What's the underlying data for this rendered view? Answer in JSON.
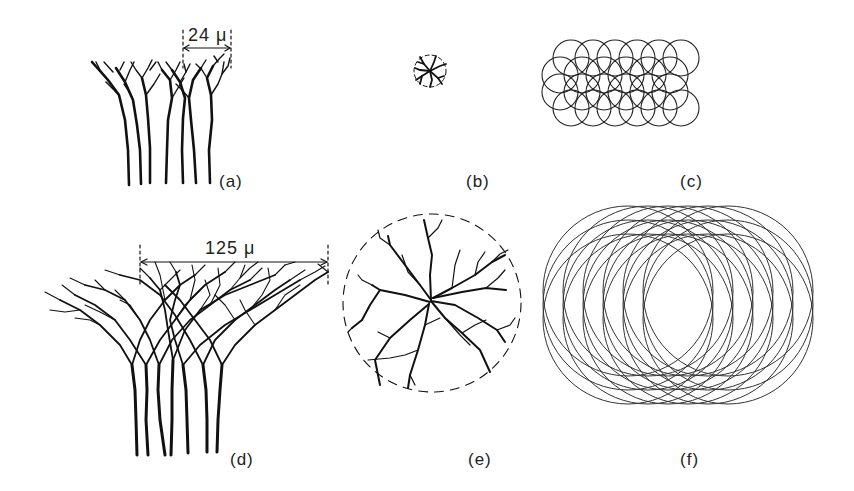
{
  "figure": {
    "panels": [
      {
        "id": "a",
        "label": "(a)",
        "description": "small branching tree cluster, side view"
      },
      {
        "id": "b",
        "label": "(b)",
        "description": "small branching pattern, top view within dashed circle"
      },
      {
        "id": "c",
        "label": "(c)",
        "description": "grid of small overlapping circles"
      },
      {
        "id": "d",
        "label": "(d)",
        "description": "large branching tree cluster, side view"
      },
      {
        "id": "e",
        "label": "(e)",
        "description": "large branching pattern, top view within dashed circle"
      },
      {
        "id": "f",
        "label": "(f)",
        "description": "field of large overlapping circles"
      }
    ],
    "scale_bars": {
      "a": "24 μ",
      "d": "125 μ"
    },
    "colors": {
      "ink": "#111111",
      "background": "#ffffff"
    }
  }
}
